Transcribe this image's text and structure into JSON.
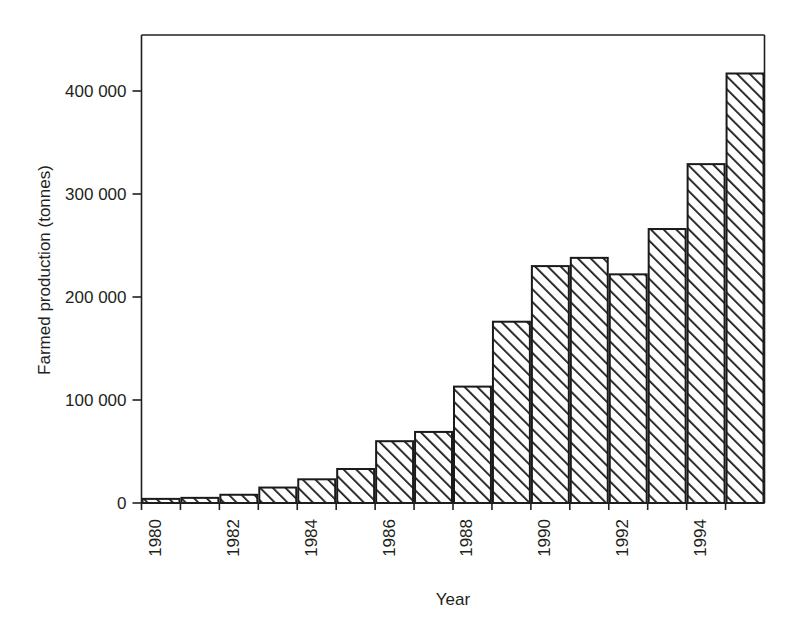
{
  "chart_data": {
    "type": "bar",
    "title": "",
    "xlabel": "Year",
    "ylabel": "Farmed production (tonnes)",
    "categories": [
      1980,
      1981,
      1982,
      1983,
      1984,
      1985,
      1986,
      1987,
      1988,
      1989,
      1990,
      1991,
      1992,
      1993,
      1994,
      1995
    ],
    "values": [
      4000,
      5000,
      8000,
      15000,
      23000,
      33000,
      60000,
      69000,
      113000,
      176000,
      230000,
      238000,
      222000,
      266000,
      329000,
      417000
    ],
    "ylim": [
      0,
      440000
    ],
    "xlim": [
      1979.5,
      1995.5
    ],
    "ytick_values": [
      0,
      100000,
      200000,
      300000,
      400000
    ],
    "ytick_labels": [
      "0",
      "100 000",
      "200 000",
      "300 000",
      "400 000"
    ],
    "xtick_values": [
      1980,
      1982,
      1984,
      1986,
      1988,
      1990,
      1992,
      1994
    ],
    "xtick_labels": [
      "1980",
      "1982",
      "1984",
      "1986",
      "1988",
      "1990",
      "1992",
      "1994"
    ],
    "xtick_rotation": 90,
    "grid": false,
    "legend": null,
    "bar_fill": "#ffffff",
    "bar_edge_color": "#1a1a1a",
    "bar_hatch": "diagonal-forward-slash",
    "axis_color": "#231f20",
    "background": "#ffffff"
  }
}
